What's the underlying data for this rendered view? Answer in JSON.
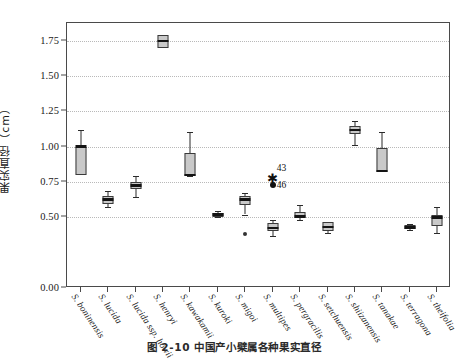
{
  "chart_data": {
    "type": "bar",
    "plot_kind": "boxplot",
    "title": "",
    "xlabel": "",
    "ylabel": "果实直径（cm）",
    "ylim": [
      0.0,
      1.875
    ],
    "grid": true,
    "legend": "none",
    "ytick_labels": [
      "1.75",
      "1.50",
      "1.25",
      "1.00",
      "0.75",
      "0.50",
      "0.00"
    ],
    "ytick_values": [
      1.75,
      1.5,
      1.25,
      1.0,
      0.75,
      0.5,
      0.0
    ],
    "categories": [
      "S. boninensis",
      "S. lucida",
      "S. lucida ssp. howii",
      "S. henryi",
      "S. kawakamii",
      "S. kuroki",
      "S. migoi",
      "S. multipes",
      "S. pergracilis",
      "S. setchuensis",
      "S. shiizanensis",
      "S. tanakae",
      "S. terragona",
      "S. theifolia"
    ],
    "boxes": [
      {
        "category": "S. boninensis",
        "whisker_low": 0.8,
        "q1": 0.8,
        "median": 1.0,
        "q3": 1.0,
        "whisker_high": 1.115
      },
      {
        "category": "S. lucida",
        "whisker_low": 0.57,
        "q1": 0.595,
        "median": 0.628,
        "q3": 0.65,
        "whisker_high": 0.683
      },
      {
        "category": "S. lucida ssp. howii",
        "whisker_low": 0.645,
        "q1": 0.7,
        "median": 0.727,
        "q3": 0.748,
        "whisker_high": 0.795
      },
      {
        "category": "S. henryi",
        "whisker_low": 1.7,
        "q1": 1.7,
        "median": 1.748,
        "q3": 1.79,
        "whisker_high": 1.79
      },
      {
        "category": "S. kawakamii",
        "whisker_low": 0.79,
        "q1": 0.795,
        "median": 0.8,
        "q3": 0.952,
        "whisker_high": 1.105
      },
      {
        "category": "S. kuroki",
        "whisker_low": 0.5,
        "q1": 0.505,
        "median": 0.52,
        "q3": 0.532,
        "whisker_high": 0.545
      },
      {
        "category": "S. migoi",
        "whisker_low": 0.52,
        "q1": 0.585,
        "median": 0.628,
        "q3": 0.65,
        "whisker_high": 0.672
      },
      {
        "category": "S. multipes",
        "whisker_low": 0.37,
        "q1": 0.4,
        "median": 0.425,
        "q3": 0.46,
        "whisker_high": 0.478
      },
      {
        "category": "S. pergracilis",
        "whisker_low": 0.478,
        "q1": 0.492,
        "median": 0.505,
        "q3": 0.54,
        "whisker_high": 0.585
      },
      {
        "category": "S. setchuensis",
        "whisker_low": 0.392,
        "q1": 0.4,
        "median": 0.432,
        "q3": 0.468,
        "whisker_high": 0.47
      },
      {
        "category": "S. shiizanensis",
        "whisker_low": 1.01,
        "q1": 1.09,
        "median": 1.118,
        "q3": 1.148,
        "whisker_high": 1.182
      },
      {
        "category": "S. tanakae",
        "whisker_low": 0.82,
        "q1": 0.82,
        "median": 0.828,
        "q3": 0.99,
        "whisker_high": 1.105
      },
      {
        "category": "S. terragona",
        "whisker_low": 0.412,
        "q1": 0.42,
        "median": 0.43,
        "q3": 0.448,
        "whisker_high": 0.455
      },
      {
        "category": "S. theifolia",
        "whisker_low": 0.392,
        "q1": 0.44,
        "median": 0.498,
        "q3": 0.52,
        "whisker_high": 0.57
      }
    ],
    "outliers": [
      {
        "category": "S. multipes",
        "label": "43",
        "value": 0.775,
        "marker": "asterisk"
      },
      {
        "category": "S. multipes",
        "label": "46",
        "value": 0.728,
        "marker": "filled-circle"
      },
      {
        "category": "S. migoi",
        "label": "",
        "value": 0.385,
        "marker": "small-dot"
      }
    ]
  },
  "caption": {
    "text": "图 2-10   中国产小檗属各种果实直径"
  }
}
